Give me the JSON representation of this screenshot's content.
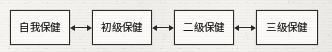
{
  "diagram": {
    "type": "flow-chart",
    "orientation": "horizontal",
    "background_color": "#f3f2ef",
    "ink_color": "#2a2927",
    "box_fill_color": "#fbfaf8",
    "nodes": [
      {
        "id": "self-care",
        "label": "自我保健"
      },
      {
        "id": "primary-care",
        "label": "初级保健"
      },
      {
        "id": "secondary-care",
        "label": "二级保健"
      },
      {
        "id": "tertiary-care",
        "label": "三级保健"
      }
    ],
    "connectors": [
      {
        "id": "connector-0",
        "from": "self-care",
        "to": "primary-care",
        "icon": "double-arrow-icon",
        "glyph": "↔"
      },
      {
        "id": "connector-1",
        "from": "primary-care",
        "to": "secondary-care",
        "icon": "double-arrow-icon",
        "glyph": "↔"
      },
      {
        "id": "connector-2",
        "from": "secondary-care",
        "to": "tertiary-care",
        "icon": "double-arrow-icon",
        "glyph": "↔"
      }
    ]
  }
}
